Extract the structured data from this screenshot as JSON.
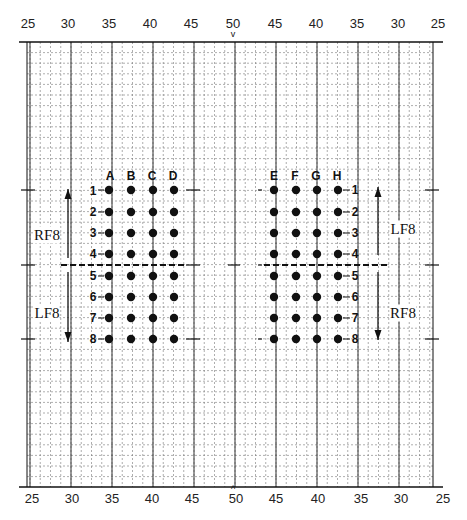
{
  "diagram": {
    "title": "",
    "top_scale": [
      "25",
      "30",
      "35",
      "40",
      "45",
      "50",
      "45",
      "40",
      "35",
      "30",
      "25"
    ],
    "bottom_scale": [
      "25",
      "30",
      "35",
      "40",
      "45",
      "50",
      "45",
      "40",
      "35",
      "30",
      "25"
    ],
    "center_marker_top": "v",
    "center_marker_bottom": "^",
    "left_group": {
      "columns": [
        "A",
        "B",
        "C",
        "D"
      ],
      "rows": [
        "1",
        "2",
        "3",
        "4",
        "5",
        "6",
        "7",
        "8"
      ],
      "upper_label": "RF8",
      "lower_label": "LF8"
    },
    "right_group": {
      "columns": [
        "E",
        "F",
        "G",
        "H"
      ],
      "rows": [
        "1",
        "2",
        "3",
        "4",
        "5",
        "6",
        "7",
        "8"
      ],
      "upper_label": "LF8",
      "lower_label": "RF8"
    },
    "colors": {
      "ink": "#111111",
      "grid_minor": "#777777",
      "grid_major": "#333333",
      "background": "#ffffff"
    }
  }
}
